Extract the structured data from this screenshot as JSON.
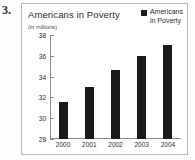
{
  "question_number": "3.",
  "legend": {
    "swatch_color": "#1d1d1d",
    "label_line1": "Americans",
    "label_line2": "in Poverty"
  },
  "chart_data": {
    "type": "bar",
    "title": "Americans in Poverty",
    "subtitle": "",
    "units_label": "(in millions)",
    "xlabel": "",
    "ylabel": "",
    "categories": [
      "2000",
      "2001",
      "2002",
      "2003",
      "2004"
    ],
    "values": [
      31.6,
      33.0,
      34.6,
      36.0,
      37.0
    ],
    "series": [
      {
        "name": "Americans in Poverty",
        "values": [
          31.6,
          33.0,
          34.6,
          36.0,
          37.0
        ],
        "color": "#1a1a1a"
      }
    ],
    "ylim": [
      28,
      38
    ],
    "yticks": [
      38,
      36,
      34,
      32,
      30,
      28
    ],
    "ytick_labels": [
      "38",
      "36",
      "34",
      "32",
      "30",
      "28"
    ],
    "grid": false,
    "legend_position": "top-right",
    "bar_color": "#1a1a1a",
    "background_color": "#ffffff",
    "border_color": "#b9b9b9",
    "axis_color": "#8c8c8c"
  }
}
